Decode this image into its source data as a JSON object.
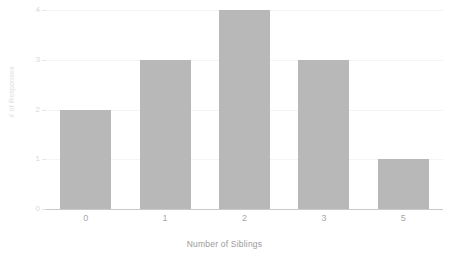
{
  "chart_data": {
    "type": "bar",
    "title": "",
    "categories": [
      "0",
      "1",
      "2",
      "3",
      "5"
    ],
    "values": [
      2,
      3,
      4,
      3,
      1
    ],
    "series": [
      {
        "name": "# of Responses",
        "values": [
          2,
          3,
          4,
          3,
          1
        ]
      }
    ],
    "xlabel": "Number of Siblings",
    "ylabel": "# of Responses",
    "ylim": [
      0,
      4
    ],
    "yticks": [
      0,
      1,
      2,
      3,
      4
    ],
    "ytick_labels": [
      "0",
      "1",
      "2",
      "3",
      "4"
    ],
    "grid": true,
    "legend": false,
    "legend_position": "none",
    "colors": {
      "bar": "#b8b8b8",
      "gridline": "#f4f4f4",
      "axis_line": "#c9c9c9",
      "xtick_text": "#a8a8a8",
      "ytick_text": "#d8d8d8",
      "xlabel_text": "#9a9a9a",
      "ylabel_text": "#dcdcdc",
      "background": "#ffffff"
    }
  }
}
